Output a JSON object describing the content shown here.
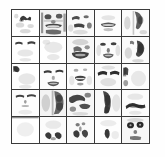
{
  "figure": {
    "title": "",
    "caption": "",
    "background_color": "#fefefe",
    "grid_line_color": "#3a3a3a",
    "cell_background_color": "#ffffff",
    "ink_color": "#1a1a1a",
    "rows": 5,
    "columns": 5,
    "cell_count": 25,
    "image_type": "grayscale facial basis images",
    "cells": [
      {
        "index": 1,
        "row": 1,
        "col": 1,
        "label": "basis-1",
        "feature": "nose-bridge-dark-arch",
        "density": "sparse"
      },
      {
        "index": 2,
        "row": 1,
        "col": 2,
        "label": "basis-2",
        "feature": "eyes-and-mouth-full-face",
        "density": "dense"
      },
      {
        "index": 3,
        "row": 1,
        "col": 3,
        "label": "basis-3",
        "feature": "upper-cheek-and-eyebrow",
        "density": "medium"
      },
      {
        "index": 4,
        "row": 1,
        "col": 4,
        "label": "basis-4",
        "feature": "mouth-lips-band",
        "density": "sparse"
      },
      {
        "index": 5,
        "row": 1,
        "col": 5,
        "label": "basis-5",
        "feature": "left-side-profile-shadow",
        "density": "medium"
      },
      {
        "index": 6,
        "row": 2,
        "col": 1,
        "label": "basis-6",
        "feature": "two-eyebrows-horizontal",
        "density": "sparse"
      },
      {
        "index": 7,
        "row": 2,
        "col": 2,
        "label": "basis-7",
        "feature": "blank-faint-forehead",
        "density": "very-sparse"
      },
      {
        "index": 8,
        "row": 2,
        "col": 3,
        "label": "basis-8",
        "feature": "chin-and-jaw-mass",
        "density": "dense"
      },
      {
        "index": 9,
        "row": 2,
        "col": 4,
        "label": "basis-9",
        "feature": "eyes-nose-mouth-face",
        "density": "dense"
      },
      {
        "index": 10,
        "row": 2,
        "col": 5,
        "label": "basis-10",
        "feature": "right-cheek-dark-blob",
        "density": "dense"
      },
      {
        "index": 11,
        "row": 3,
        "col": 1,
        "label": "basis-11",
        "feature": "upper-left-corner-shadow",
        "density": "sparse"
      },
      {
        "index": 12,
        "row": 3,
        "col": 2,
        "label": "basis-12",
        "feature": "eyes-and-smiling-mouth",
        "density": "medium"
      },
      {
        "index": 13,
        "row": 3,
        "col": 3,
        "label": "basis-13",
        "feature": "centered-mouth-teeth",
        "density": "medium"
      },
      {
        "index": 14,
        "row": 3,
        "col": 4,
        "label": "basis-14",
        "feature": "two-heavy-eyebrows",
        "density": "medium"
      },
      {
        "index": 15,
        "row": 3,
        "col": 5,
        "label": "basis-15",
        "feature": "left-edge-vertical-band",
        "density": "sparse"
      },
      {
        "index": 16,
        "row": 4,
        "col": 1,
        "label": "basis-16",
        "feature": "eyes-and-nose-thin",
        "density": "sparse"
      },
      {
        "index": 17,
        "row": 4,
        "col": 2,
        "label": "basis-17",
        "feature": "half-face-dark-right",
        "density": "dense"
      },
      {
        "index": 18,
        "row": 4,
        "col": 3,
        "label": "basis-18",
        "feature": "hair-and-brow-swirl",
        "density": "dense"
      },
      {
        "index": 19,
        "row": 4,
        "col": 4,
        "label": "basis-19",
        "feature": "vertical-dark-column",
        "density": "dense"
      },
      {
        "index": 20,
        "row": 4,
        "col": 5,
        "label": "basis-20",
        "feature": "dark-eyebrow-arc",
        "density": "medium"
      },
      {
        "index": 21,
        "row": 5,
        "col": 1,
        "label": "basis-21",
        "feature": "blank-white",
        "density": "very-sparse"
      },
      {
        "index": 22,
        "row": 5,
        "col": 2,
        "label": "basis-22",
        "feature": "lower-nostrils-shadow",
        "density": "medium"
      },
      {
        "index": 23,
        "row": 5,
        "col": 3,
        "label": "basis-23",
        "feature": "nose-and-nostril-pair",
        "density": "medium"
      },
      {
        "index": 24,
        "row": 5,
        "col": 4,
        "label": "basis-24",
        "feature": "single-dark-chin-mark",
        "density": "sparse"
      },
      {
        "index": 25,
        "row": 5,
        "col": 5,
        "label": "basis-25",
        "feature": "two-dark-eyes-face",
        "density": "dense"
      }
    ]
  }
}
